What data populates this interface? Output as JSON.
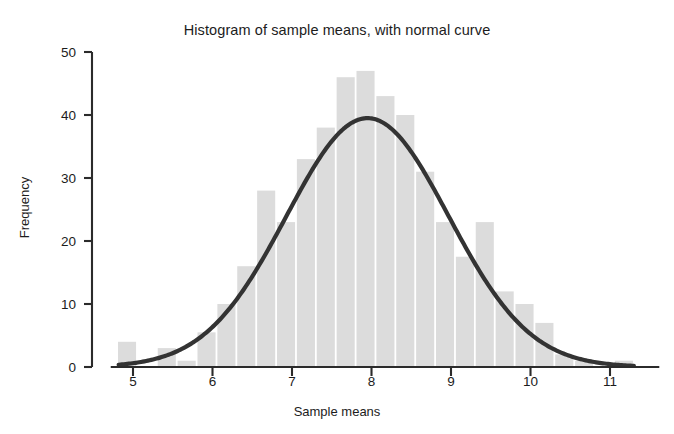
{
  "chart_data": {
    "type": "bar",
    "title": "Histogram of sample means, with normal curve",
    "xlabel": "Sample means",
    "ylabel": "Frequency",
    "xlim": [
      4.72,
      11.6
    ],
    "ylim": [
      0,
      50
    ],
    "grid": false,
    "legend": null,
    "bin_width": 0.25,
    "bar_color": "#dcdcdc",
    "curve_color": "#333333",
    "axis_color": "#2b2b2b",
    "yticks": [
      0,
      10,
      20,
      30,
      40,
      50
    ],
    "ytick_labels": [
      "0",
      "10",
      "20",
      "30",
      "40",
      "50"
    ],
    "xticks": [
      5,
      6,
      7,
      8,
      9,
      10,
      11
    ],
    "xtick_labels": [
      "5",
      "6",
      "7",
      "8",
      "9",
      "10",
      "11"
    ],
    "bin_centers": [
      4.925,
      5.175,
      5.425,
      5.675,
      5.925,
      6.175,
      6.425,
      6.675,
      6.925,
      7.175,
      7.425,
      7.675,
      7.925,
      8.175,
      8.425,
      8.675,
      8.925,
      9.175,
      9.425,
      9.675,
      9.925,
      10.175,
      10.425,
      10.675,
      10.925,
      11.175
    ],
    "values": [
      4,
      0,
      3,
      1,
      5.5,
      10,
      16,
      28,
      23,
      33,
      38,
      46,
      47,
      43,
      40,
      31,
      23,
      17.5,
      23,
      12,
      10,
      7,
      2,
      1,
      0,
      1
    ],
    "normal_curve": {
      "label": "normal curve",
      "mean": 7.95,
      "sd": 1.02,
      "peak_frequency": 39.5,
      "x_start": 4.82,
      "x_end": 11.3
    }
  }
}
